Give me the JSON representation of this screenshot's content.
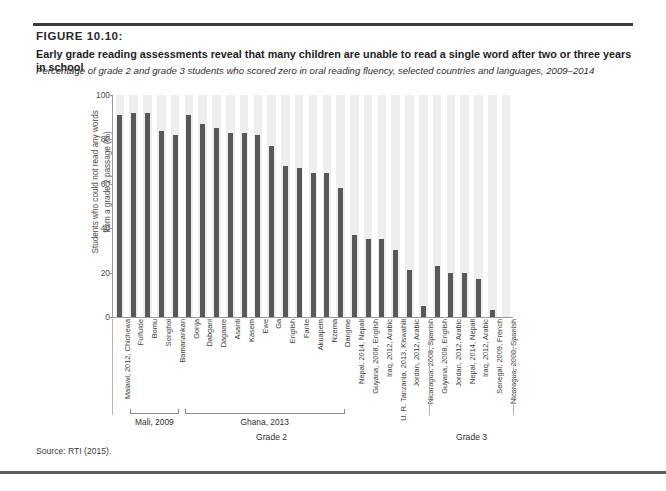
{
  "figure": {
    "number": "FIGURE 10.10:",
    "title": "Early grade reading assessments reveal that many children are unable to read a single word after two or three years in school",
    "subtitle": "Percentage of grade 2 and grade 3 students who scored zero in oral reading fluency, selected countries and languages, 2009–2014",
    "source": "Source: RTI (2015)."
  },
  "chart_data": {
    "type": "bar",
    "title": "Early grade reading assessments reveal that many children are unable to read a single word after two or three years in school",
    "subtitle": "Percentage of grade 2 and grade 3 students who scored zero in oral reading fluency, selected countries and languages, 2009–2014",
    "xlabel": "",
    "ylabel": "Students who could not read any words from a grade 2 passage (%)",
    "ylim": [
      0,
      100
    ],
    "yticks": [
      0,
      20,
      40,
      60,
      80,
      100
    ],
    "ytick_labels": [
      "0",
      "20",
      "40",
      "60",
      "80",
      "100"
    ],
    "grid": false,
    "legend": false,
    "bar_color": "#56585c",
    "band_color": "#eeeeee",
    "categories": [
      "Malawi, 2012, Chichewa",
      "Fulfulde",
      "Bomu",
      "Songhoi",
      "Bamanankan",
      "Gonja",
      "Dabgani",
      "Dagaare",
      "Asanti",
      "Kasem",
      "Ewe",
      "Ga",
      "English",
      "Fante",
      "Akuapem",
      "Nzema",
      "Dangme",
      "Nepal, 2014, Nepali",
      "Guyana, 2008, English",
      "Iraq, 2012, Arabic",
      "U. R. Tanzania, 2013, Kiswahili",
      "Jordan, 2012, Arabic",
      "Nicaragua, 2008, Spanish",
      "Guyana, 2008, English",
      "Jordan, 2012, Arabic",
      "Nepal, 2014, Nepali",
      "Iraq, 2012, Arabic",
      "Senegal, 2009, French",
      "Nicaragua, 2008, Spanish"
    ],
    "values": [
      91,
      92,
      92,
      84,
      82,
      91,
      87,
      85,
      83,
      83,
      82,
      77,
      68,
      67,
      65,
      65,
      58,
      37,
      35,
      35,
      30,
      21,
      5,
      23,
      20,
      20,
      17,
      3,
      0
    ],
    "groups": [
      {
        "label": "Mali, 2009",
        "start_index": 1,
        "end_index": 4
      },
      {
        "label": "Ghana, 2013",
        "start_index": 5,
        "end_index": 16
      }
    ],
    "grade_sections": [
      {
        "label": "Grade 2",
        "start_index": 0,
        "end_index": 22
      },
      {
        "label": "Grade 3",
        "start_index": 23,
        "end_index": 28
      }
    ]
  }
}
